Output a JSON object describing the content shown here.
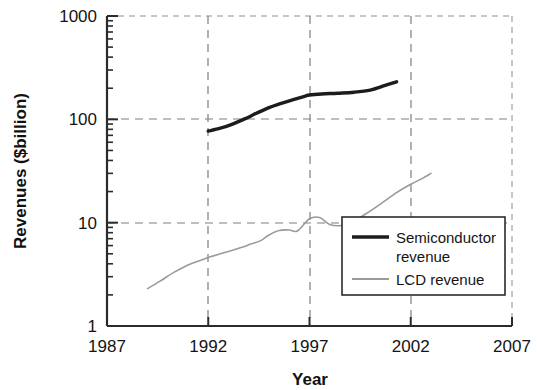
{
  "chart_data": {
    "type": "line",
    "title": "",
    "xlabel": "Year",
    "ylabel": "Revenues ($billion)",
    "yscale": "log",
    "ylim": [
      1,
      1000
    ],
    "xlim": [
      1987,
      2007
    ],
    "grid": true,
    "grid_style": "dashed",
    "legend_position": "lower right",
    "ytick_labels": [
      "1000",
      "100",
      "10",
      "1"
    ],
    "ytick_values": [
      1000,
      100,
      10,
      1
    ],
    "xtick_labels": [
      "1987",
      "1992",
      "1997",
      "2002",
      "2007"
    ],
    "xtick_values": [
      1987,
      1992,
      1997,
      2002,
      2007
    ],
    "series": [
      {
        "name": "Semiconductor revenue",
        "legend_label_line1": "Semiconductor",
        "legend_label_line2": "revenue",
        "color": "#1c1c1c",
        "width": 3.4,
        "x": [
          1992.0,
          1992.6,
          1993.2,
          1993.8,
          1994.4,
          1995.0,
          1995.6,
          1996.2,
          1996.8,
          1997.0,
          1997.6,
          1998.4,
          1999.2,
          2000.0,
          2000.7,
          2001.3
        ],
        "y": [
          77,
          82,
          90,
          101,
          115,
          130,
          143,
          155,
          168,
          172,
          176,
          179,
          183,
          192,
          212,
          231
        ]
      },
      {
        "name": "LCD revenue",
        "legend_label_line1": "LCD revenue",
        "legend_label_line2": "",
        "color": "#9a9a9a",
        "width": 1.6,
        "x": [
          1989.0,
          1989.6,
          1990.3,
          1991.0,
          1991.6,
          1992.0,
          1992.6,
          1993.2,
          1993.7,
          1994.1,
          1994.6,
          1995.0,
          1995.5,
          1996.0,
          1996.4,
          1997.0,
          1997.5,
          1998.0,
          1998.6,
          1999.2,
          1999.9,
          2000.6,
          2001.3,
          2002.0,
          2002.6,
          2003.0
        ],
        "y": [
          2.3,
          2.7,
          3.3,
          3.9,
          4.3,
          4.6,
          5.0,
          5.4,
          5.8,
          6.2,
          6.7,
          7.6,
          8.4,
          8.5,
          8.3,
          10.9,
          11.2,
          9.6,
          9.4,
          10.4,
          12.6,
          15.6,
          19.5,
          23.5,
          27.0,
          30.0
        ]
      }
    ]
  },
  "legend": {
    "items": [
      {
        "label_line1": "Semiconductor",
        "label_line2": "revenue",
        "swatch": "thick-black-line-swatch"
      },
      {
        "label_line1": "LCD revenue",
        "label_line2": "",
        "swatch": "thin-gray-line-swatch"
      }
    ]
  },
  "colors": {
    "semiconductor": "#1c1c1c",
    "lcd": "#9a9a9a",
    "axis": "#2b2b2b",
    "grid": "#8c8c8c",
    "background": "#ffffff"
  }
}
